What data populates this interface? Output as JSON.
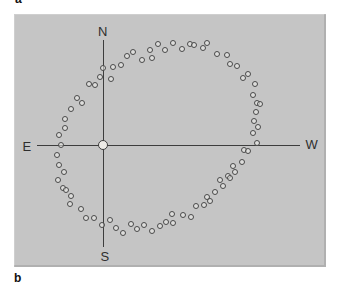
{
  "figure": {
    "panel_top_label": "a",
    "panel_bottom_label": "b"
  },
  "chart_data": {
    "type": "scatter",
    "cardinal_labels": {
      "north": "N",
      "south": "S",
      "east": "E",
      "west": "W"
    },
    "axes": {
      "north_south_line": {
        "x": 103,
        "y_top": 40,
        "y_bottom": 247
      },
      "east_west_line": {
        "y": 145,
        "x_left": 37,
        "x_right": 300
      },
      "note_orientation": "East on left, West on right"
    },
    "center_point_px": {
      "x": 103,
      "y": 145
    },
    "points_px": [
      [
        103,
        68
      ],
      [
        113,
        67
      ],
      [
        121,
        65
      ],
      [
        127,
        56
      ],
      [
        133,
        52
      ],
      [
        142,
        60
      ],
      [
        150,
        50
      ],
      [
        152,
        58
      ],
      [
        158,
        44
      ],
      [
        165,
        50
      ],
      [
        173,
        43
      ],
      [
        182,
        49
      ],
      [
        190,
        44
      ],
      [
        194,
        45
      ],
      [
        203,
        48
      ],
      [
        207,
        43
      ],
      [
        217,
        54
      ],
      [
        227,
        55
      ],
      [
        230,
        64
      ],
      [
        237,
        66
      ],
      [
        248,
        74
      ],
      [
        243,
        78
      ],
      [
        255,
        84
      ],
      [
        253,
        95
      ],
      [
        257,
        103
      ],
      [
        260,
        104
      ],
      [
        256,
        112
      ],
      [
        254,
        121
      ],
      [
        258,
        127
      ],
      [
        253,
        133
      ],
      [
        257,
        143
      ],
      [
        244,
        150
      ],
      [
        248,
        151
      ],
      [
        242,
        162
      ],
      [
        233,
        166
      ],
      [
        235,
        172
      ],
      [
        228,
        176
      ],
      [
        230,
        178
      ],
      [
        220,
        180
      ],
      [
        223,
        186
      ],
      [
        215,
        192
      ],
      [
        207,
        197
      ],
      [
        210,
        201
      ],
      [
        204,
        205
      ],
      [
        196,
        206
      ],
      [
        191,
        217
      ],
      [
        183,
        215
      ],
      [
        172,
        214
      ],
      [
        173,
        223
      ],
      [
        166,
        222
      ],
      [
        160,
        226
      ],
      [
        152,
        231
      ],
      [
        144,
        225
      ],
      [
        137,
        229
      ],
      [
        131,
        224
      ],
      [
        123,
        233
      ],
      [
        116,
        228
      ],
      [
        110,
        220
      ],
      [
        102,
        225
      ],
      [
        94,
        218
      ],
      [
        86,
        218
      ],
      [
        81,
        209
      ],
      [
        70,
        204
      ],
      [
        71,
        196
      ],
      [
        63,
        188
      ],
      [
        66,
        190
      ],
      [
        58,
        180
      ],
      [
        64,
        172
      ],
      [
        59,
        165
      ],
      [
        57,
        155
      ],
      [
        61,
        145
      ],
      [
        59,
        135
      ],
      [
        65,
        128
      ],
      [
        65,
        119
      ],
      [
        71,
        109
      ],
      [
        77,
        98
      ],
      [
        82,
        103
      ],
      [
        100,
        77
      ],
      [
        111,
        79
      ],
      [
        95,
        85
      ],
      [
        89,
        84
      ]
    ],
    "colors": {
      "panel_bg": "#c5c5c5",
      "axis": "#3d3d3d",
      "point_outline": "#4a4a4a",
      "point_fill": "rgba(240,240,237,0.55)",
      "center_fill": "#edebe7",
      "text": "#2e2e2e"
    }
  }
}
